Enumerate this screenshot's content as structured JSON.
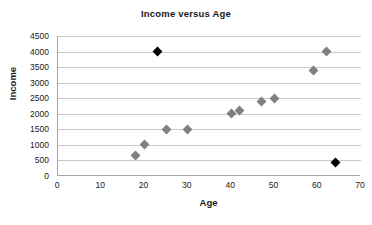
{
  "chart_data": {
    "type": "scatter",
    "title": "Income versus Age",
    "xlabel": "Age",
    "ylabel": "Income",
    "xlim": [
      0,
      70
    ],
    "ylim": [
      0,
      4500
    ],
    "xticks": [
      0,
      10,
      20,
      30,
      40,
      50,
      60,
      70
    ],
    "yticks": [
      0,
      500,
      1000,
      1500,
      2000,
      2500,
      3000,
      3500,
      4000,
      4500
    ],
    "grid": "horizontal",
    "legend": "none",
    "colors": {
      "normal_point": "#808080",
      "outlier_point": "#000000",
      "gridline": "#c9c9c9",
      "axis": "#a6a6a6",
      "text": "#1a1a1a",
      "background": "#ffffff"
    },
    "marker": "diamond",
    "series": [
      {
        "name": "Income",
        "points": [
          {
            "x": 18,
            "y": 650,
            "kind": "normal"
          },
          {
            "x": 20,
            "y": 1000,
            "kind": "normal"
          },
          {
            "x": 23,
            "y": 4000,
            "kind": "outlier"
          },
          {
            "x": 25,
            "y": 1500,
            "kind": "normal"
          },
          {
            "x": 30,
            "y": 1500,
            "kind": "normal"
          },
          {
            "x": 40,
            "y": 2000,
            "kind": "normal"
          },
          {
            "x": 42,
            "y": 2100,
            "kind": "normal"
          },
          {
            "x": 47,
            "y": 2400,
            "kind": "normal"
          },
          {
            "x": 50,
            "y": 2500,
            "kind": "normal"
          },
          {
            "x": 59,
            "y": 3400,
            "kind": "normal"
          },
          {
            "x": 62,
            "y": 4000,
            "kind": "normal"
          },
          {
            "x": 64,
            "y": 450,
            "kind": "outlier"
          }
        ]
      }
    ]
  }
}
